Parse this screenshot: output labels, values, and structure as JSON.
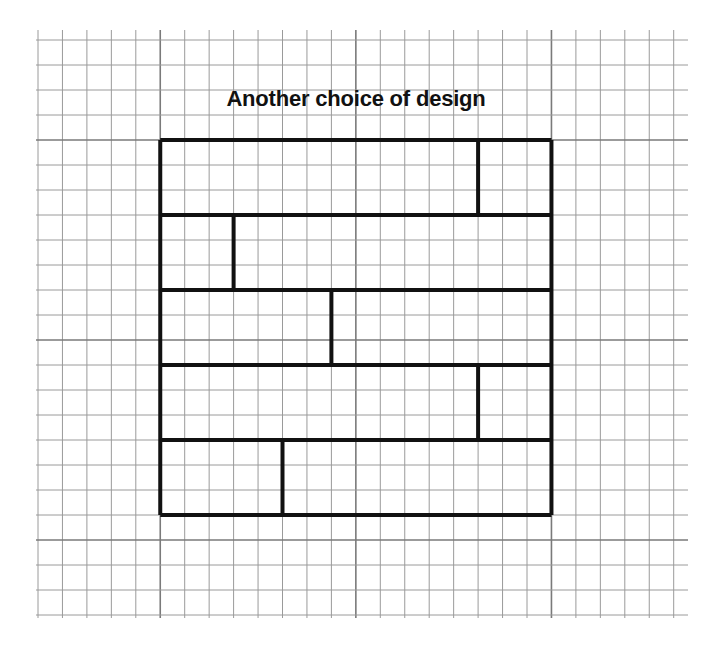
{
  "title": "Another choice of design",
  "grid": {
    "origin_x": 38,
    "origin_y": 40,
    "cell_w": 24.45,
    "cell_h": 25.0,
    "cols": 26,
    "rows": 23,
    "major_every": 8,
    "major_col_offset": 5,
    "major_row_offset": 4,
    "minor_color": "#9a9a9a",
    "major_color": "#7a7a7a",
    "h_line_extent_x": 688
  },
  "design": {
    "col_start": 5,
    "row_start": 4,
    "width_cells": 16,
    "row_height_cells": 3,
    "stroke_color": "#111111",
    "rows": [
      {
        "split": [
          13,
          3
        ]
      },
      {
        "split": [
          3,
          13
        ]
      },
      {
        "split": [
          7,
          9
        ]
      },
      {
        "split": [
          13,
          3
        ]
      },
      {
        "split": [
          5,
          11
        ]
      }
    ]
  }
}
